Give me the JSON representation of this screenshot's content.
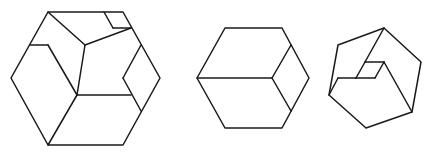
{
  "figure": {
    "stroke_color": "#1a1a1a",
    "background": "#ffffff"
  },
  "shapes": [
    {
      "id": "dissected-hexagon",
      "outline": [
        [
          48,
          12
        ],
        [
          123,
          12
        ],
        [
          160,
          78
        ],
        [
          123,
          145
        ],
        [
          48,
          145
        ],
        [
          11,
          78
        ]
      ],
      "segments": [
        [
          [
            48,
            12
          ],
          [
            85,
            45
          ]
        ],
        [
          [
            85,
            45
          ],
          [
            131,
            28
          ]
        ],
        [
          [
            104,
            12
          ],
          [
            113,
            28
          ]
        ],
        [
          [
            113,
            28
          ],
          [
            131,
            28
          ]
        ],
        [
          [
            85,
            45
          ],
          [
            77,
            95
          ]
        ],
        [
          [
            30,
            45
          ],
          [
            48,
            45
          ]
        ],
        [
          [
            48,
            45
          ],
          [
            77,
            95
          ]
        ],
        [
          [
            77,
            95
          ],
          [
            48,
            145
          ]
        ],
        [
          [
            77,
            95
          ],
          [
            131,
            95
          ]
        ],
        [
          [
            141,
            45
          ],
          [
            123,
            78
          ]
        ],
        [
          [
            123,
            78
          ],
          [
            141,
            111
          ]
        ]
      ]
    },
    {
      "id": "cube-hexagon",
      "outline": [
        [
          225,
          28
        ],
        [
          282,
          28
        ],
        [
          309,
          78
        ],
        [
          282,
          128
        ],
        [
          225,
          128
        ],
        [
          197,
          78
        ]
      ],
      "segments": [
        [
          [
            197,
            78
          ],
          [
            272,
            78
          ]
        ],
        [
          [
            272,
            78
          ],
          [
            291,
            45
          ]
        ],
        [
          [
            272,
            78
          ],
          [
            291,
            111
          ]
        ]
      ]
    },
    {
      "id": "rotated-notched-cube",
      "outline": [
        [
          384,
          28
        ],
        [
          421,
          62
        ],
        [
          412,
          112
        ],
        [
          366,
          128
        ],
        [
          329,
          95
        ],
        [
          338,
          45
        ]
      ],
      "segments": [
        [
          [
            384,
            28
          ],
          [
            365,
            62
          ]
        ],
        [
          [
            365,
            62
          ],
          [
            384,
            62
          ]
        ],
        [
          [
            384,
            62
          ],
          [
            375,
            78
          ]
        ],
        [
          [
            375,
            78
          ],
          [
            356,
            78
          ]
        ],
        [
          [
            356,
            78
          ],
          [
            365,
            62
          ]
        ],
        [
          [
            384,
            62
          ],
          [
            412,
            112
          ]
        ],
        [
          [
            329,
            95
          ],
          [
            338,
            78
          ]
        ],
        [
          [
            338,
            78
          ],
          [
            356,
            78
          ]
        ]
      ]
    }
  ]
}
